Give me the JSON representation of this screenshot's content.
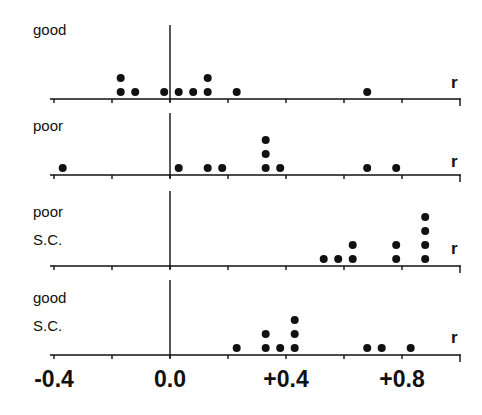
{
  "chart_data": {
    "type": "scatter",
    "subtype": "stacked-dot-plot",
    "xlabel": "r",
    "xlim": [
      -0.4,
      1.0
    ],
    "x_ticks": [
      -0.4,
      -0.2,
      0.0,
      0.2,
      0.4,
      0.6,
      0.8,
      1.0
    ],
    "x_tick_labels": [
      "-0.4",
      "0.0",
      "+0.4",
      "+0.8"
    ],
    "x_tick_label_values": [
      -0.4,
      0.0,
      0.4,
      0.8
    ],
    "grid": false,
    "legend": null,
    "panels": [
      {
        "label_lines": [
          "good"
        ],
        "axis_label": "r",
        "values": [
          -0.17,
          -0.17,
          -0.12,
          -0.02,
          0.03,
          0.08,
          0.13,
          0.13,
          0.23,
          0.68
        ]
      },
      {
        "label_lines": [
          "poor"
        ],
        "axis_label": "r",
        "values": [
          -0.37,
          0.03,
          0.13,
          0.18,
          0.33,
          0.33,
          0.33,
          0.38,
          0.68,
          0.78
        ]
      },
      {
        "label_lines": [
          "poor",
          "S.C."
        ],
        "axis_label": "r",
        "values": [
          0.53,
          0.58,
          0.63,
          0.63,
          0.78,
          0.78,
          0.88,
          0.88,
          0.88,
          0.88
        ]
      },
      {
        "label_lines": [
          "good",
          "S.C."
        ],
        "axis_label": "r",
        "values": [
          0.23,
          0.33,
          0.33,
          0.38,
          0.43,
          0.43,
          0.43,
          0.68,
          0.73,
          0.83
        ]
      }
    ]
  },
  "layout": {
    "x_origin_px": 170,
    "px_per_unit": 290,
    "axis_left_px": 50,
    "axis_right_px": 461,
    "dot_radius": 4,
    "dot_step": 14,
    "panel_geometry": [
      {
        "baseline": 99,
        "vtop": 25,
        "label_top": 22,
        "r_top": 74
      },
      {
        "baseline": 175,
        "vtop": 113,
        "label_top": 118,
        "r_top": 153
      },
      {
        "baseline": 266,
        "vtop": 191,
        "label_top": 204,
        "r_top": 240
      },
      {
        "baseline": 355,
        "vtop": 280,
        "label_top": 290,
        "r_top": 329
      }
    ],
    "tick_label_top": 368,
    "ink_color": "#111111"
  }
}
